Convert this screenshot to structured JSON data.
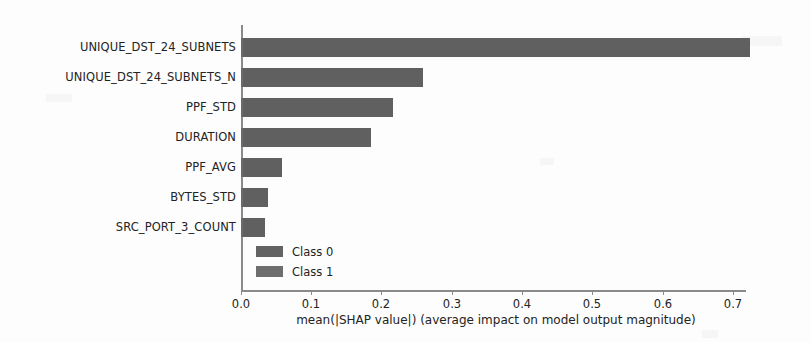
{
  "chart_data": {
    "type": "bar",
    "orientation": "horizontal",
    "title": "",
    "xlabel": "mean(|SHAP value|) (average impact on model output magnitude)",
    "ylabel": "",
    "categories": [
      "UNIQUE_DST_24_SUBNETS",
      "UNIQUE_DST_24_SUBNETS_N",
      "PPF_STD",
      "DURATION",
      "PPF_AVG",
      "BYTES_STD",
      "SRC_PORT_3_COUNT"
    ],
    "values": [
      0.724,
      0.259,
      0.216,
      0.185,
      0.058,
      0.038,
      0.034
    ],
    "series": [
      {
        "name": "Class 0",
        "color": "#636363",
        "values": [
          0.724,
          0.259,
          0.216,
          0.185,
          0.058,
          0.038,
          0.034
        ]
      },
      {
        "name": "Class 1",
        "color": "#6e6e6e",
        "values": [
          0,
          0,
          0,
          0,
          0,
          0,
          0
        ]
      }
    ],
    "xlim": [
      0.0,
      0.74
    ],
    "xticks": [
      0.0,
      0.1,
      0.2,
      0.3,
      0.4,
      0.5,
      0.6,
      0.7
    ],
    "xticklabels": [
      "0.0",
      "0.1",
      "0.2",
      "0.3",
      "0.4",
      "0.5",
      "0.6",
      "0.7"
    ],
    "grid": false,
    "legend": {
      "position": "lower-left-inside",
      "entries": [
        {
          "label": "Class 0",
          "color": "#636363"
        },
        {
          "label": "Class 1",
          "color": "#6e6e6e"
        }
      ]
    },
    "bar_color": "#636363",
    "background_color": "#fdfdfd",
    "axis_color": "#8a8a8a"
  }
}
